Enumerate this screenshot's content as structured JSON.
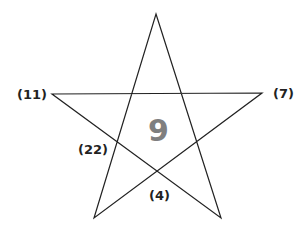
{
  "diagram": {
    "type": "pentagram-number-puzzle",
    "center_value": "9",
    "center_color": "#7f7f7f",
    "labels": {
      "left": "(11)",
      "right": "(7)",
      "lower_left": "(22)",
      "bottom": "(4)"
    },
    "line_color": "#222222"
  }
}
